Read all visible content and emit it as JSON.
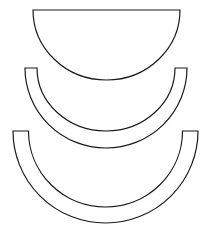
{
  "canvas": {
    "width": 203,
    "height": 231,
    "background": "#ffffff"
  },
  "style": {
    "stroke": "#1a1a1a",
    "stroke_width": 1.2,
    "fill": "#ffffff"
  },
  "shapes": [
    {
      "id": "half-disc",
      "kind": "half-disc",
      "top_y": 10,
      "cx": 106.5,
      "outer": {
        "rx": 73.5,
        "ry": 70
      }
    },
    {
      "id": "half-ring-small",
      "kind": "half-ring",
      "top_y": 68,
      "cx": 106,
      "outer": {
        "rx": 81,
        "ry": 80
      },
      "inner": {
        "rx": 69,
        "ry": 63
      }
    },
    {
      "id": "half-ring-large",
      "kind": "half-ring",
      "top_y": 131,
      "cx": 105.5,
      "outer": {
        "rx": 92.5,
        "ry": 92
      },
      "inner": {
        "rx": 77,
        "ry": 76
      }
    }
  ]
}
